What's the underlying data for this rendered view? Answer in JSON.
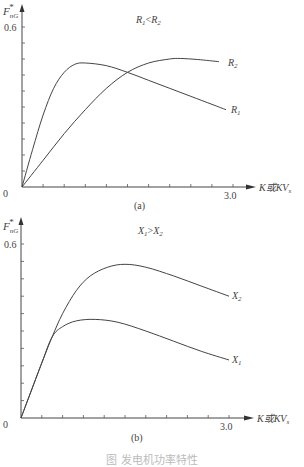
{
  "figure_caption": "图 发电机功率特性",
  "chart_data": [
    {
      "type": "line",
      "panel_label": "(a)",
      "title": "R1<R2",
      "condition": "R₁<R₂",
      "ylabel": "F*nG",
      "xlabel": "K或KVs",
      "xlim": [
        0,
        3.0
      ],
      "ylim": [
        0,
        0.6
      ],
      "x_tick_labels": [
        "0",
        "3.0"
      ],
      "y_tick_labels": [
        "0.6"
      ],
      "x_ticks_count": 10,
      "y_ticks_count": 10,
      "grid": false,
      "series": [
        {
          "name": "R1",
          "label": "R₁",
          "x": [
            0,
            0.15,
            0.3,
            0.45,
            0.6,
            0.75,
            0.9,
            1.2,
            1.5,
            1.8,
            2.1,
            2.4,
            2.7,
            2.9
          ],
          "y": [
            0,
            0.14,
            0.27,
            0.37,
            0.43,
            0.46,
            0.465,
            0.455,
            0.43,
            0.4,
            0.37,
            0.34,
            0.31,
            0.29
          ]
        },
        {
          "name": "R2",
          "label": "R₂",
          "x": [
            0,
            0.3,
            0.6,
            0.9,
            1.2,
            1.5,
            1.8,
            2.1,
            2.25,
            2.5,
            2.8
          ],
          "y": [
            0,
            0.1,
            0.2,
            0.29,
            0.37,
            0.43,
            0.465,
            0.48,
            0.482,
            0.478,
            0.47
          ]
        }
      ]
    },
    {
      "type": "line",
      "panel_label": "(b)",
      "title": "X1>X2",
      "condition": "X₁>X₂",
      "ylabel": "F*nG",
      "xlabel": "K或KVs",
      "xlim": [
        0,
        3.0
      ],
      "ylim": [
        0,
        0.6
      ],
      "x_tick_labels": [
        "0",
        "3.0"
      ],
      "y_tick_labels": [
        "0.6"
      ],
      "x_ticks_count": 10,
      "y_ticks_count": 10,
      "grid": false,
      "series": [
        {
          "name": "X1",
          "label": "X₁",
          "x": [
            0,
            0.3,
            0.45,
            0.6,
            0.8,
            1.07,
            1.4,
            1.8,
            2.2,
            2.6,
            3.0
          ],
          "y": [
            0,
            0.19,
            0.28,
            0.315,
            0.335,
            0.34,
            0.33,
            0.3,
            0.265,
            0.23,
            0.2
          ]
        },
        {
          "name": "X2",
          "label": "X₂",
          "x": [
            0,
            0.3,
            0.45,
            0.6,
            0.8,
            1.0,
            1.25,
            1.5,
            1.8,
            2.2,
            2.6,
            3.0
          ],
          "y": [
            0,
            0.19,
            0.28,
            0.36,
            0.44,
            0.49,
            0.52,
            0.53,
            0.52,
            0.49,
            0.455,
            0.42
          ]
        }
      ]
    }
  ],
  "labels": {
    "a": {
      "y_axis": "F",
      "y_sup": "*",
      "y_sub": "nG",
      "y_tick": "0.6",
      "origin": "0",
      "x_end": "3.0",
      "x_axis": "K或KV",
      "x_axis_sub": "s",
      "panel": "(a)",
      "cond_l": "R",
      "cond_l_sub": "1",
      "cond_op": "<",
      "cond_r": "R",
      "cond_r_sub": "2",
      "s1": "R",
      "s1_sub": "1",
      "s2": "R",
      "s2_sub": "2"
    },
    "b": {
      "y_axis": "F",
      "y_sup": "*",
      "y_sub": "nG",
      "y_tick": "0.6",
      "origin": "0",
      "x_end": "3.0",
      "x_axis": "K或KV",
      "x_axis_sub": "s",
      "panel": "(b)",
      "cond_l": "X",
      "cond_l_sub": "1",
      "cond_op": ">",
      "cond_r": "X",
      "cond_r_sub": "2",
      "s1": "X",
      "s1_sub": "1",
      "s2": "X",
      "s2_sub": "2"
    }
  }
}
